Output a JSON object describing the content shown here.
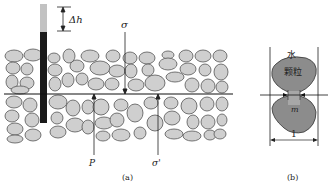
{
  "figure_a": {
    "caption": "(a)",
    "labels": {
      "delta_h": "Δh",
      "sigma": "σ",
      "pore_pressure": "P",
      "effective_stress": "σ'"
    }
  },
  "figure_b": {
    "caption": "(b)",
    "labels": {
      "water": "水",
      "particle": "颗粒",
      "contact_area": "m",
      "unit_width": "1"
    }
  },
  "colors": {
    "grain_fill": "#cfcfcf",
    "grain_stroke": "#555555",
    "line": "#111111",
    "pipe_dark": "#1a1a1a",
    "pipe_light": "#bfbfbf"
  }
}
